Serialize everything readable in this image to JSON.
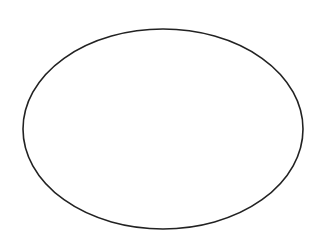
{
  "canvas": {
    "width": 323,
    "height": 244,
    "background": "#ffffff"
  },
  "shapes": [
    {
      "type": "ellipse",
      "cx": 163,
      "cy": 129,
      "rx": 140,
      "ry": 100,
      "stroke": "#222222",
      "stroke_width": 1.6,
      "fill": "none"
    }
  ]
}
